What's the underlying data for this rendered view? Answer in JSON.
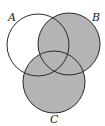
{
  "diagram": {
    "type": "venn",
    "sets": [
      {
        "label": "A",
        "cx": 38,
        "cy": 45,
        "r": 31,
        "shaded": false
      },
      {
        "label": "B",
        "cx": 69,
        "cy": 44,
        "r": 31,
        "shaded": true
      },
      {
        "label": "C",
        "cx": 54,
        "cy": 82,
        "r": 31,
        "shaded": true
      }
    ],
    "shaded_region": "B ∪ C",
    "colors": {
      "fill": "#b4b4b4",
      "stroke": "#2a2a2a",
      "background": "#ffffff"
    },
    "labels": {
      "a": "A",
      "b": "B",
      "c": "C"
    }
  }
}
